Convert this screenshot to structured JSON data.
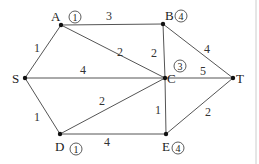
{
  "diagram": {
    "type": "weighted-graph",
    "nodes": [
      {
        "id": "A",
        "label": "A",
        "x": 61,
        "y": 25,
        "badge": "1"
      },
      {
        "id": "B",
        "label": "B",
        "x": 163,
        "y": 24,
        "badge": "4"
      },
      {
        "id": "S",
        "label": "S",
        "x": 25,
        "y": 78,
        "badge": ""
      },
      {
        "id": "C",
        "label": "C",
        "x": 165,
        "y": 78,
        "badge": "3"
      },
      {
        "id": "T",
        "label": "T",
        "x": 233,
        "y": 78,
        "badge": ""
      },
      {
        "id": "D",
        "label": "D",
        "x": 60,
        "y": 134,
        "badge": "1"
      },
      {
        "id": "E",
        "label": "E",
        "x": 166,
        "y": 134,
        "badge": "4"
      }
    ],
    "edges": [
      {
        "from": "S",
        "to": "A",
        "weight": "1"
      },
      {
        "from": "A",
        "to": "B",
        "weight": "3"
      },
      {
        "from": "A",
        "to": "C",
        "weight": "2"
      },
      {
        "from": "S",
        "to": "C",
        "weight": "4"
      },
      {
        "from": "B",
        "to": "C",
        "weight": "2"
      },
      {
        "from": "B",
        "to": "T",
        "weight": "4"
      },
      {
        "from": "C",
        "to": "T",
        "weight": "5"
      },
      {
        "from": "S",
        "to": "D",
        "weight": "1"
      },
      {
        "from": "D",
        "to": "C",
        "weight": "2"
      },
      {
        "from": "D",
        "to": "E",
        "weight": "4"
      },
      {
        "from": "C",
        "to": "E",
        "weight": "1"
      },
      {
        "from": "E",
        "to": "T",
        "weight": "2"
      }
    ],
    "labels": {
      "A": "A",
      "B": "B",
      "S": "S",
      "C": "C",
      "T": "T",
      "D": "D",
      "E": "E"
    },
    "badges": {
      "A": "1",
      "B": "4",
      "C": "3",
      "D": "1",
      "E": "4"
    },
    "weights": {
      "SA": "1",
      "AB": "3",
      "AC": "2",
      "SC": "4",
      "BC": "2",
      "BT": "4",
      "CT": "5",
      "SD": "1",
      "DC": "2",
      "DE": "4",
      "CE": "1",
      "ET": "2"
    },
    "colors": {
      "edge": "#555555",
      "node": "#111111",
      "text": "#222222",
      "border": "#cccccc"
    }
  }
}
